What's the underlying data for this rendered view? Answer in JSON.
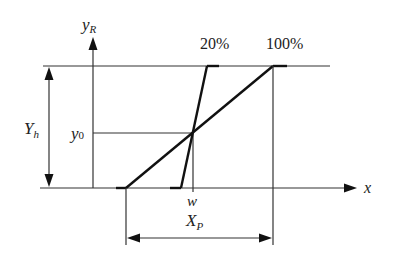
{
  "diagram": {
    "type": "proportional-band characteristic",
    "axes": {
      "vertical_label_main": "y",
      "vertical_label_sub": "R",
      "horizontal_label": "x"
    },
    "labels": {
      "band_20": "20%",
      "band_100": "100%",
      "Yh_main": "Y",
      "Yh_sub": "h",
      "y0_main": "y",
      "y0_sub": "0",
      "w": "w",
      "Xp_main": "X",
      "Xp_sub": "P"
    },
    "colors": {
      "line": "#111111",
      "background": "#ffffff"
    }
  }
}
